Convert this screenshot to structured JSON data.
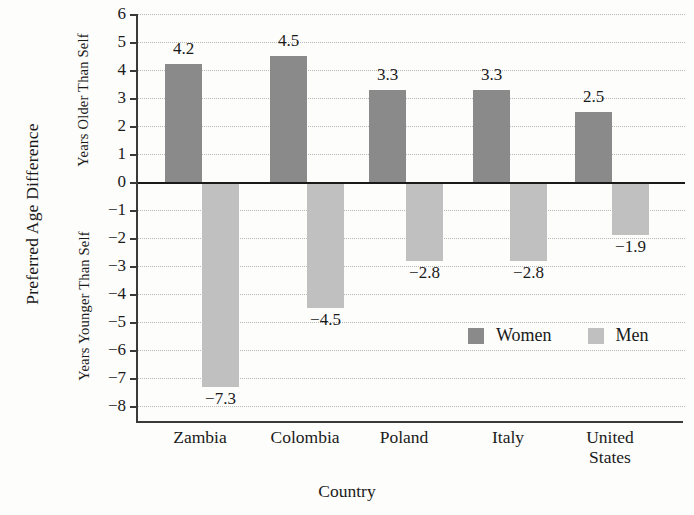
{
  "chart_data": {
    "type": "bar",
    "title": "",
    "xlabel": "Country",
    "ylabel": "Preferred Age Difference",
    "ylabel_upper": "Years Older Than Self",
    "ylabel_lower": "Years Younger Than Self",
    "categories": [
      "Zambia",
      "Colombia",
      "Poland",
      "Italy",
      "United States"
    ],
    "series": [
      {
        "name": "Women",
        "color": "#8a8a8a",
        "values": [
          4.2,
          4.5,
          3.3,
          3.3,
          2.5
        ]
      },
      {
        "name": "Men",
        "color": "#c0c0c0",
        "values": [
          -7.3,
          -4.5,
          -2.8,
          -2.8,
          -1.9
        ]
      }
    ],
    "value_labels": {
      "Women": [
        "4.2",
        "4.5",
        "3.3",
        "3.3",
        "2.5"
      ],
      "Men": [
        "−7.3",
        "−4.5",
        "−2.8",
        "−2.8",
        "−1.9"
      ]
    },
    "ylim": [
      -8.6,
      6
    ],
    "yticks": [
      6,
      5,
      4,
      3,
      2,
      1,
      0,
      -1,
      -2,
      -3,
      -4,
      -5,
      -6,
      -7,
      -8
    ],
    "ytick_labels": [
      "6",
      "5",
      "4",
      "3",
      "2",
      "1",
      "0",
      "−1",
      "−2",
      "−3",
      "−4",
      "−5",
      "−6",
      "−7",
      "−8"
    ],
    "grid": true,
    "legend_position": "inside-lower-right",
    "legend": [
      "Women",
      "Men"
    ],
    "zero_line": 0
  },
  "xtick_display": [
    "Zambia",
    "Colombia",
    "Poland",
    "Italy",
    "United\nStates"
  ]
}
